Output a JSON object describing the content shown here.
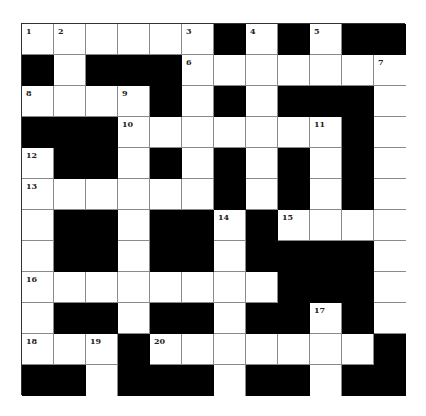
{
  "puzzle": {
    "rows": 12,
    "cols": 12,
    "colors": {
      "block": "#000000",
      "cell": "#ffffff",
      "line": "#8a8a8a",
      "number": "#222222"
    },
    "grid": [
      "WWWWWWBWBWBB",
      "BWBBBWWWWWWW",
      "WWWWBWBWBBBW",
      "BBBWWWWWWWBW",
      "WBBWBWBWBWBW",
      "WWWWWWBWBWBW",
      "WBBWBBWBWWWW",
      "WBBWBBWBBBBW",
      "WWWWWWWWBBBW",
      "WBBWBBWBBWBW",
      "WWWBWWWWWWWB",
      "BBWBBBWBBWBB"
    ],
    "numbers": [
      {
        "row": 0,
        "col": 0,
        "n": "1"
      },
      {
        "row": 0,
        "col": 1,
        "n": "2"
      },
      {
        "row": 0,
        "col": 5,
        "n": "3"
      },
      {
        "row": 0,
        "col": 7,
        "n": "4"
      },
      {
        "row": 0,
        "col": 9,
        "n": "5"
      },
      {
        "row": 1,
        "col": 5,
        "n": "6"
      },
      {
        "row": 1,
        "col": 11,
        "n": "7"
      },
      {
        "row": 2,
        "col": 0,
        "n": "8"
      },
      {
        "row": 2,
        "col": 3,
        "n": "9"
      },
      {
        "row": 3,
        "col": 3,
        "n": "10"
      },
      {
        "row": 3,
        "col": 9,
        "n": "11"
      },
      {
        "row": 4,
        "col": 0,
        "n": "12"
      },
      {
        "row": 5,
        "col": 0,
        "n": "13"
      },
      {
        "row": 6,
        "col": 6,
        "n": "14"
      },
      {
        "row": 6,
        "col": 8,
        "n": "15"
      },
      {
        "row": 8,
        "col": 0,
        "n": "16"
      },
      {
        "row": 9,
        "col": 9,
        "n": "17"
      },
      {
        "row": 10,
        "col": 0,
        "n": "18"
      },
      {
        "row": 10,
        "col": 2,
        "n": "19"
      },
      {
        "row": 10,
        "col": 4,
        "n": "20"
      }
    ]
  }
}
